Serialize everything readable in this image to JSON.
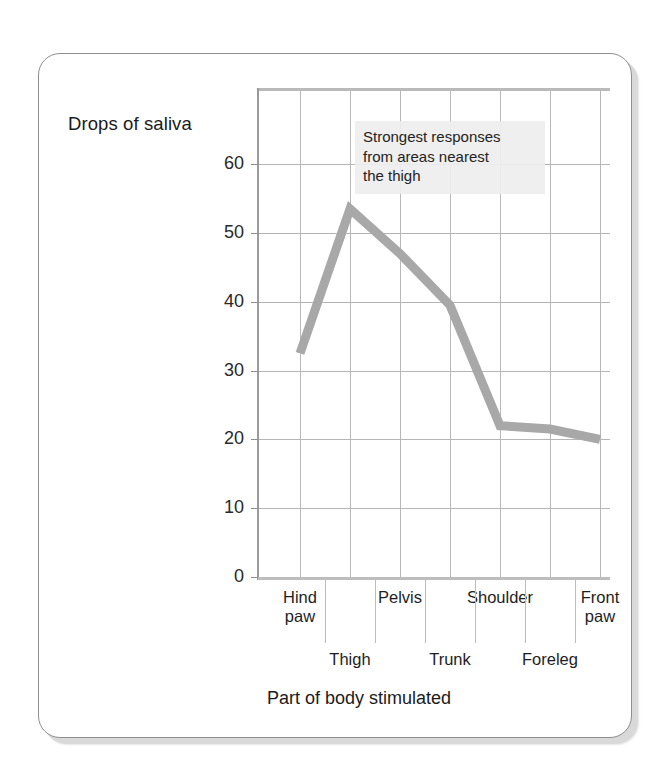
{
  "chart_data": {
    "type": "line",
    "title": "",
    "xlabel": "Part of body stimulated",
    "ylabel": "Drops of saliva",
    "categories": [
      "Hind paw",
      "Thigh",
      "Pelvis",
      "Trunk",
      "Shoulder",
      "Foreleg",
      "Front paw"
    ],
    "values": [
      32.5,
      53.5,
      47,
      39.5,
      22,
      21.5,
      20
    ],
    "series": [
      {
        "name": "Drops of saliva",
        "values": [
          32.5,
          53.5,
          47,
          39.5,
          22,
          21.5,
          20
        ]
      }
    ],
    "ylim": [
      0,
      70
    ],
    "yticks": [
      0,
      10,
      20,
      30,
      40,
      50,
      60
    ],
    "ytick_labels": [
      "0",
      "10",
      "20",
      "30",
      "40",
      "50",
      "60"
    ],
    "grid": true,
    "legend": "none",
    "line_color": "#a8a8a8",
    "annotations": [
      {
        "text": "Strongest responses from areas nearest the thigh",
        "lines": [
          "Strongest responses",
          "from areas nearest",
          "the thigh"
        ]
      }
    ]
  },
  "axis": {
    "y_caption": "Drops of saliva",
    "x_caption": "Part of body stimulated",
    "yticks": [
      {
        "label": "60"
      },
      {
        "label": "50"
      },
      {
        "label": "40"
      },
      {
        "label": "30"
      },
      {
        "label": "20"
      },
      {
        "label": "10"
      },
      {
        "label": "0"
      }
    ],
    "xlabels": [
      {
        "line1": "Hind",
        "line2": "paw",
        "row": "upper"
      },
      {
        "line1": "Thigh",
        "line2": "",
        "row": "lower"
      },
      {
        "line1": "Pelvis",
        "line2": "",
        "row": "upper"
      },
      {
        "line1": "Trunk",
        "line2": "",
        "row": "lower"
      },
      {
        "line1": "Shoulder",
        "line2": "",
        "row": "upper"
      },
      {
        "line1": "Foreleg",
        "line2": "",
        "row": "lower"
      },
      {
        "line1": "Front",
        "line2": "paw",
        "row": "upper"
      }
    ]
  },
  "annotation": {
    "line1": "Strongest responses",
    "line2": "from areas nearest",
    "line3": "the thigh"
  }
}
